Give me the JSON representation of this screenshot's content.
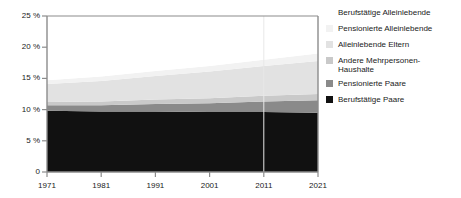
{
  "chart_data": {
    "type": "area",
    "title": "",
    "subtitle": "",
    "xlabel": "",
    "ylabel": "",
    "stacked": true,
    "grid": false,
    "legend_position": "right",
    "x": [
      1971,
      1981,
      1991,
      2001,
      2011,
      2021
    ],
    "xtick_labels": [
      "1971",
      "1981",
      "1991",
      "2001",
      "2011",
      "2021"
    ],
    "xlim": [
      1971,
      2021
    ],
    "ylim": [
      0,
      25
    ],
    "ytick_values": [
      0,
      5,
      10,
      15,
      20,
      25
    ],
    "ytick_labels": [
      "0",
      "5 %",
      "10 %",
      "15 %",
      "20 %",
      "25 %"
    ],
    "vertical_gridlines_at": [
      2011
    ],
    "series": [
      {
        "name": "Berufstätige Paare",
        "color": "#111111",
        "values": [
          9.8,
          9.7,
          9.7,
          9.6,
          9.6,
          9.5
        ]
      },
      {
        "name": "Pensionierte Paare",
        "color": "#8a8a8a",
        "values": [
          0.9,
          1.0,
          1.2,
          1.4,
          1.7,
          2.0
        ]
      },
      {
        "name": "Andere Mehrpersonen-\nHaushalte",
        "color": "#c9c9c9",
        "values": [
          0.5,
          0.6,
          0.7,
          0.8,
          0.9,
          1.0
        ]
      },
      {
        "name": "Alleinlebende Eltern",
        "color": "#e2e2e2",
        "values": [
          2.9,
          3.3,
          3.8,
          4.3,
          4.8,
          5.3
        ]
      },
      {
        "name": "Pensionierte Alleinlebende",
        "color": "#f2f2f2",
        "values": [
          0.6,
          0.7,
          0.8,
          0.9,
          1.0,
          1.2
        ]
      },
      {
        "name": "Berufstätige Alleinlebende",
        "color": "#ffffff",
        "values": [
          0.5,
          0.6,
          0.7,
          0.8,
          0.9,
          1.0
        ]
      }
    ],
    "totals": [
      15.2,
      15.9,
      16.9,
      17.8,
      18.9,
      20.0
    ]
  },
  "axes": {
    "y_ticks": [
      {
        "label": "25 %",
        "value": 25
      },
      {
        "label": "20 %",
        "value": 20
      },
      {
        "label": "15 %",
        "value": 15
      },
      {
        "label": "10 %",
        "value": 10
      },
      {
        "label": "5 %",
        "value": 5
      },
      {
        "label": "0",
        "value": 0
      }
    ],
    "x_ticks": [
      {
        "label": "1971",
        "value": 1971
      },
      {
        "label": "1981",
        "value": 1981
      },
      {
        "label": "1991",
        "value": 1991
      },
      {
        "label": "2001",
        "value": 2001
      },
      {
        "label": "2011",
        "value": 2011
      },
      {
        "label": "2021",
        "value": 2021
      }
    ]
  },
  "legend": {
    "items": [
      {
        "label": "Berufstätige Alleinlebende",
        "color": "#ffffff",
        "border": "#ffffff"
      },
      {
        "label": "Pensionierte Alleinlebende",
        "color": "#f2f2f2",
        "border": "#f2f2f2"
      },
      {
        "label": "Alleinlebende Eltern",
        "color": "#e2e2e2",
        "border": "#e2e2e2"
      },
      {
        "label": "Andere Mehrpersonen-\nHaushalte",
        "color": "#c9c9c9",
        "border": "#c9c9c9"
      },
      {
        "label": "Pensionierte Paare",
        "color": "#8a8a8a",
        "border": "#8a8a8a"
      },
      {
        "label": "Berufstätige Paare",
        "color": "#111111",
        "border": "#111111"
      }
    ]
  },
  "style": {
    "axis_color": "#8c8c8c",
    "text_color": "#1a1a1a",
    "background": "#ffffff",
    "gridline_color": "#e8e8e8"
  }
}
